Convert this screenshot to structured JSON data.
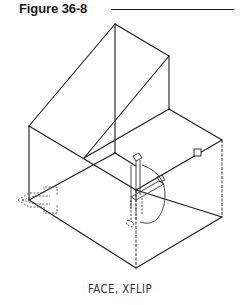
{
  "figure": {
    "title": "Figure 36-8",
    "caption": "FACE, XFLIP"
  },
  "drawing": {
    "description": "Isometric wireframe of stepped block with UCS face selection icons",
    "line_color": "#1a1a1a",
    "dashed_color": "#555555"
  }
}
